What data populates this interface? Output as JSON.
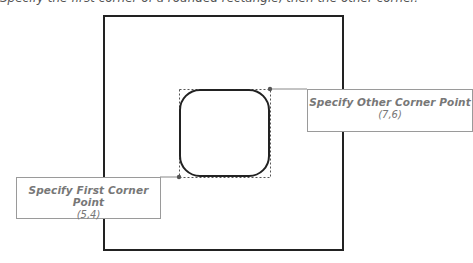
{
  "header": {
    "text": "Specify the first corner of a rounded rectangle, then the other corner."
  },
  "drawing": {
    "outer_rect": {
      "x": 104,
      "y": 16,
      "w": 239,
      "h": 234
    },
    "bounding_box": {
      "x1": 179,
      "y1": 89,
      "x2": 270,
      "y2": 177
    },
    "shape": "rounded-rectangle"
  },
  "callouts": {
    "first": {
      "title": "Specify First Corner Point",
      "coord": "(5,4)"
    },
    "other": {
      "title": "Specify Other Corner Point",
      "coord": "(7,6)"
    }
  }
}
